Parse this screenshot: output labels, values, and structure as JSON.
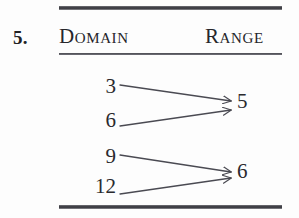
{
  "exercise": {
    "number_label": "5."
  },
  "table": {
    "headers": {
      "domain_label": "Domain",
      "range_label": "Range"
    }
  },
  "mapping": {
    "domain_values": [
      {
        "label": "3",
        "left": 86,
        "top": 74,
        "width": 30
      },
      {
        "label": "6",
        "left": 86,
        "top": 108,
        "width": 30
      },
      {
        "label": "9",
        "left": 86,
        "top": 144,
        "width": 30
      },
      {
        "label": "12",
        "left": 76,
        "top": 174,
        "width": 40
      }
    ],
    "range_values": [
      {
        "label": "5",
        "left": 237,
        "top": 89
      },
      {
        "label": "6",
        "left": 237,
        "top": 159
      }
    ],
    "arrows": [
      {
        "name": "arrow-3-to-5",
        "x1": 120,
        "y1": 85,
        "x2": 231,
        "y2": 101
      },
      {
        "name": "arrow-6-to-5",
        "x1": 120,
        "y1": 126,
        "x2": 231,
        "y2": 110
      },
      {
        "name": "arrow-9-to-6",
        "x1": 120,
        "y1": 155,
        "x2": 231,
        "y2": 172
      },
      {
        "name": "arrow-12-to-6",
        "x1": 120,
        "y1": 194,
        "x2": 231,
        "y2": 178
      }
    ],
    "pairs": [
      {
        "domain": "3",
        "range": "5"
      },
      {
        "domain": "6",
        "range": "5"
      },
      {
        "domain": "9",
        "range": "6"
      },
      {
        "domain": "12",
        "range": "6"
      }
    ]
  },
  "colors": {
    "background": "#fdfdfd",
    "ink": "#2a2a2e",
    "rule": "#3a3a40",
    "arrow": "#4a4a52"
  }
}
